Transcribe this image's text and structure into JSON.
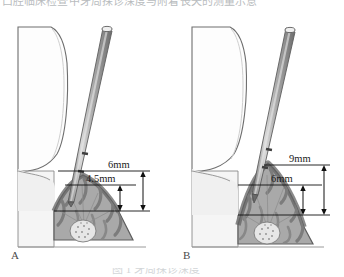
{
  "figure": {
    "header_text": "口腔临床检查中牙周探诊深度与附着丧失的测量示意",
    "caption_text": "图 1  牙周探诊深度",
    "panels": [
      {
        "id": "A",
        "label": "A",
        "measurements": [
          {
            "name": "outer-measure",
            "value": "6mm"
          },
          {
            "name": "inner-measure",
            "value": "4.5mm"
          }
        ]
      },
      {
        "id": "B",
        "label": "B",
        "measurements": [
          {
            "name": "outer-measure",
            "value": "9mm"
          },
          {
            "name": "inner-measure",
            "value": "6mm"
          }
        ]
      }
    ]
  },
  "colors": {
    "tooth_fill": "#fdfdfd",
    "tooth_outline": "#6e6e6e",
    "gingiva_fill": "#f3f3f3",
    "bone_cortical": "#6f6f6f",
    "bone_trabecular": "#9a9a9a",
    "bone_body": "#a9a9a9",
    "pulp_fill": "#e2e2e2",
    "probe_body": "#9e9e9e",
    "probe_highlight": "#d8d8d8",
    "probe_outline": "#5d5d5d",
    "measure_line": "#111111",
    "text": "#1b1b1b"
  }
}
